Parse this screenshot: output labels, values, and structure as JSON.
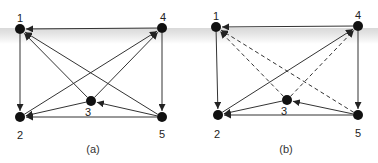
{
  "figure": {
    "background_band_color": "#dedede",
    "edge_color": "#333333",
    "node_color": "#111111",
    "panels": [
      {
        "caption": "(a)",
        "nodes": [
          {
            "id": "1",
            "x": 20,
            "y": 29,
            "label_x": 20,
            "label_y": 22
          },
          {
            "id": "2",
            "x": 20,
            "y": 117,
            "label_x": 20,
            "label_y": 139
          },
          {
            "id": "3",
            "x": 91,
            "y": 101,
            "label_x": 88,
            "label_y": 116
          },
          {
            "id": "4",
            "x": 162,
            "y": 28,
            "label_x": 163,
            "label_y": 21
          },
          {
            "id": "5",
            "x": 162,
            "y": 117,
            "label_x": 162,
            "label_y": 138
          }
        ],
        "edges": [
          {
            "from": "4",
            "to": "1",
            "style": "solid"
          },
          {
            "from": "1",
            "to": "2",
            "style": "solid"
          },
          {
            "from": "4",
            "to": "5",
            "style": "solid"
          },
          {
            "from": "5",
            "to": "2",
            "style": "solid"
          },
          {
            "from": "3",
            "to": "2",
            "style": "solid"
          },
          {
            "from": "5",
            "to": "3",
            "style": "solid"
          },
          {
            "from": "3",
            "to": "1",
            "style": "solid"
          },
          {
            "from": "5",
            "to": "1",
            "style": "solid"
          },
          {
            "from": "2",
            "to": "4",
            "style": "solid"
          },
          {
            "from": "3",
            "to": "4",
            "style": "solid"
          }
        ],
        "caption_x": 93,
        "caption_y": 153
      },
      {
        "caption": "(b)",
        "nodes": [
          {
            "id": "1",
            "x": 216,
            "y": 27,
            "label_x": 216,
            "label_y": 20
          },
          {
            "id": "2",
            "x": 218,
            "y": 115,
            "label_x": 217,
            "label_y": 138
          },
          {
            "id": "3",
            "x": 287,
            "y": 100,
            "label_x": 284,
            "label_y": 115
          },
          {
            "id": "4",
            "x": 358,
            "y": 26,
            "label_x": 358,
            "label_y": 19
          },
          {
            "id": "5",
            "x": 358,
            "y": 115,
            "label_x": 358,
            "label_y": 137
          }
        ],
        "edges": [
          {
            "from": "4",
            "to": "1",
            "style": "solid"
          },
          {
            "from": "1",
            "to": "2",
            "style": "solid"
          },
          {
            "from": "4",
            "to": "5",
            "style": "solid"
          },
          {
            "from": "5",
            "to": "2",
            "style": "solid"
          },
          {
            "from": "3",
            "to": "2",
            "style": "solid"
          },
          {
            "from": "5",
            "to": "3",
            "style": "solid"
          },
          {
            "from": "2",
            "to": "4",
            "style": "solid"
          },
          {
            "from": "3",
            "to": "1",
            "style": "dashed"
          },
          {
            "from": "5",
            "to": "1",
            "style": "dashed"
          },
          {
            "from": "3",
            "to": "4",
            "style": "dashed"
          }
        ],
        "caption_x": 286,
        "caption_y": 153
      }
    ]
  }
}
